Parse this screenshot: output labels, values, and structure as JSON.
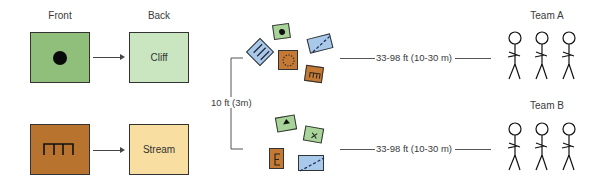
{
  "legend": {
    "front_label": "Front",
    "back_label": "Back",
    "rows": [
      {
        "front_icon": "dot-icon",
        "front_color": "#8fbf7a",
        "back_label": "Cliff",
        "back_color": "#c9e6c0"
      },
      {
        "front_icon": "comb-icon",
        "front_color": "#b8742e",
        "back_label": "Stream",
        "back_color": "#f8dea0"
      }
    ]
  },
  "spacing": {
    "vertical_label": "10 ft (3m)"
  },
  "groups": [
    {
      "cards": [
        {
          "symbol": "dot",
          "color": "#a8d49a"
        },
        {
          "symbol": "triple-lines",
          "color": "#a9c9ea"
        },
        {
          "symbol": "dotted-circle",
          "color": "#c47a34"
        },
        {
          "symbol": "dashed-diagonal",
          "color": "#a9c9ea"
        },
        {
          "symbol": "m-shape",
          "color": "#c47a34"
        }
      ],
      "distance_label": "33-98 ft (10-30 m)",
      "team_label": "Team A"
    },
    {
      "cards": [
        {
          "symbol": "triangle",
          "color": "#a8d49a"
        },
        {
          "symbol": "x-mark",
          "color": "#a8d49a"
        },
        {
          "symbol": "e-shape",
          "color": "#c47a34"
        },
        {
          "symbol": "dashed-diagonal",
          "color": "#a9c9ea"
        }
      ],
      "distance_label": "33-98 ft (10-30 m)",
      "team_label": "Team B"
    }
  ],
  "colors": {
    "green_dark": "#8fbf7a",
    "green_light": "#c9e6c0",
    "brown": "#b8742e",
    "tan": "#f8dea0",
    "blue": "#a9c9ea",
    "line": "#444444"
  }
}
